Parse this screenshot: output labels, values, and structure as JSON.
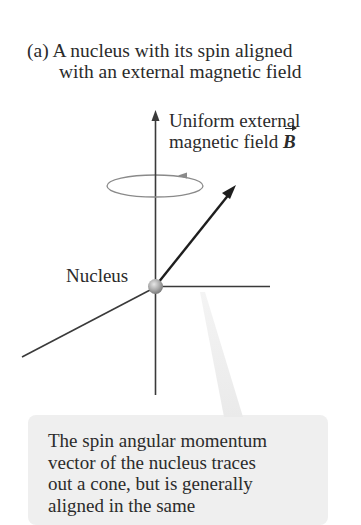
{
  "caption": {
    "label": "(a)",
    "line1": "(a) A nucleus with its spin aligned",
    "line2": "with an external magnetic field"
  },
  "field": {
    "line1": "Uniform external",
    "line2": "magnetic field ",
    "symbol": "B"
  },
  "nucleus": {
    "label": "Nucleus"
  },
  "callout": {
    "lines": [
      "The spin angular momentum",
      "vector of the nucleus traces",
      "out a cone, but is generally",
      "aligned in the same"
    ]
  },
  "colors": {
    "axis": "#3a3a3a",
    "vector": "#1e1e1e",
    "orbit": "#8a8a8a",
    "callout_bg": "#efefef",
    "nucleus": "#a8a8a8"
  }
}
